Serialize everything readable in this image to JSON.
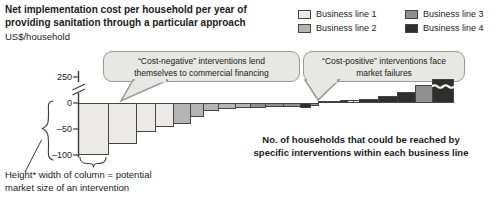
{
  "title": {
    "line1": "Net implementation cost per household per year of",
    "line2": "providing sanitation through a particular approach",
    "unit_label": "US$/household"
  },
  "legend": {
    "items": [
      {
        "label": "Business line 1",
        "color": "#eceae6"
      },
      {
        "label": "Business line 2",
        "color": "#b4b4b2"
      },
      {
        "label": "Business line 3",
        "color": "#8f8f8d"
      },
      {
        "label": "Business line 4",
        "color": "#2f2f2d"
      }
    ]
  },
  "callouts": {
    "cost_negative": {
      "line1": "“Cost-negative” interventions lend",
      "line2": "themselves to commercial financing"
    },
    "cost_positive": {
      "line1": "“Cost-positive” interventions face",
      "line2": "market failures"
    }
  },
  "y_axis": {
    "tick_labels": [
      "250",
      "0",
      "–50",
      "–100"
    ],
    "break_between": "0 and 250"
  },
  "notes": {
    "market_size_line1": "Height* width of column = potential",
    "market_size_line2": "market size of an intervention",
    "x_axis_line1": "No. of households that could be reached by",
    "x_axis_line2": "specific interventions within each business line"
  },
  "chart_data": {
    "type": "bar",
    "variant": "stepped cost curve (waterfall-style, variable-width columns)",
    "title": "Net implementation cost per household per year of providing sanitation through a particular approach",
    "ylabel": "US$/household",
    "xlabel": "No. of households that could be reached by specific interventions within each business line",
    "y_ticks": [
      250,
      0,
      -50,
      -100
    ],
    "y_axis_break_above_zero": true,
    "column_meaning": "Height* width of column = potential market size of an intervention",
    "bars": [
      {
        "business_line": 1,
        "relative_width": 30,
        "net_cost_usd": -100
      },
      {
        "business_line": 1,
        "relative_width": 28,
        "net_cost_usd": -78
      },
      {
        "business_line": 1,
        "relative_width": 19,
        "net_cost_usd": -55
      },
      {
        "business_line": 1,
        "relative_width": 18,
        "net_cost_usd": -46
      },
      {
        "business_line": 2,
        "relative_width": 17,
        "net_cost_usd": -41
      },
      {
        "business_line": 2,
        "relative_width": 13,
        "net_cost_usd": -26
      },
      {
        "business_line": 2,
        "relative_width": 15,
        "net_cost_usd": -15
      },
      {
        "business_line": 2,
        "relative_width": 17,
        "net_cost_usd": -12
      },
      {
        "business_line": 2,
        "relative_width": 15,
        "net_cost_usd": -10
      },
      {
        "business_line": 3,
        "relative_width": 15,
        "net_cost_usd": -9
      },
      {
        "business_line": 3,
        "relative_width": 18,
        "net_cost_usd": -8
      },
      {
        "business_line": 3,
        "relative_width": 17,
        "net_cost_usd": -7
      },
      {
        "business_line": 4,
        "relative_width": 10,
        "net_cost_usd": -10
      },
      {
        "business_line": 3,
        "relative_width": 8,
        "net_cost_usd": -5
      },
      {
        "business_line": 1,
        "relative_width": 5,
        "net_cost_usd": 4
      },
      {
        "business_line": 4,
        "relative_width": 17,
        "net_cost_usd": 4
      },
      {
        "business_line": 4,
        "relative_width": 7,
        "net_cost_usd": 6
      },
      {
        "business_line": 1,
        "relative_width": 6,
        "net_cost_usd": 6
      },
      {
        "business_line": 1,
        "relative_width": 6,
        "net_cost_usd": 6
      },
      {
        "business_line": 4,
        "relative_width": 19,
        "net_cost_usd": 8
      },
      {
        "business_line": 4,
        "relative_width": 19,
        "net_cost_usd": 14
      },
      {
        "business_line": 4,
        "relative_width": 18,
        "net_cost_usd": 21
      },
      {
        "business_line": 3,
        "relative_width": 17,
        "net_cost_usd": 35
      },
      {
        "business_line": 4,
        "relative_width": 21,
        "net_cost_usd": 250,
        "truncated": true
      }
    ]
  }
}
